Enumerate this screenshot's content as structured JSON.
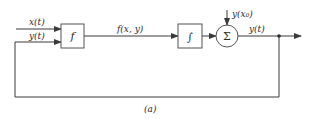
{
  "diagram": {
    "caption": "(a)",
    "inputs": {
      "x": "x(t)",
      "y": "y(t)"
    },
    "blocks": {
      "function": "f",
      "integrator": "∫",
      "summer": "Σ"
    },
    "signals": {
      "f_output": "f(x, y)",
      "initial_condition": "y(x₀)",
      "output": "y(t)"
    },
    "colors": {
      "line": "#3a3a3a",
      "background": "#ffffff"
    }
  }
}
